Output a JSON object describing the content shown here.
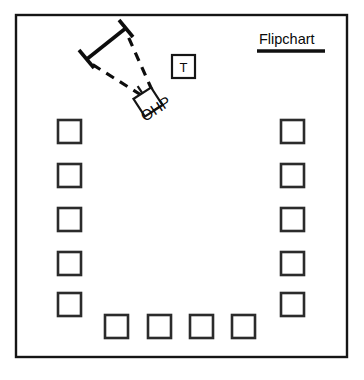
{
  "diagram": {
    "background_color": "#ffffff",
    "line_color": "#151515",
    "room": {
      "name": "room-outline",
      "x": 16,
      "y": 15,
      "width": 331,
      "height": 342
    },
    "labels": {
      "flipchart": "Flipchart",
      "ohp": "OHP",
      "trainer": "T"
    },
    "equipment": [
      {
        "name": "flipchart",
        "label": "Flipchart",
        "type": "text-with-rule",
        "x": 259,
        "y": 44
      },
      {
        "name": "trainer-table",
        "label": "T",
        "type": "square",
        "x": 172,
        "y": 55,
        "size": 23
      },
      {
        "name": "overhead-projector",
        "label": "OHP",
        "type": "rotated-square",
        "cx": 148,
        "cy": 102,
        "size": 21,
        "rotation": -33
      },
      {
        "name": "projection-screen",
        "label": "",
        "type": "screen",
        "x1": 87,
        "y1": 59,
        "x2": 126,
        "y2": 28
      }
    ],
    "projection_beam": {
      "name": "projection-beam",
      "style": "dashed",
      "rays": [
        {
          "from_x": 141,
          "from_y": 94,
          "to_x": 90,
          "to_y": 62
        },
        {
          "from_x": 152,
          "from_y": 90,
          "to_x": 126,
          "to_y": 33
        }
      ]
    },
    "seats": {
      "count": 14,
      "size": 23,
      "left_column": [
        {
          "name": "seat-left-1",
          "x": 58,
          "y": 120
        },
        {
          "name": "seat-left-2",
          "x": 58,
          "y": 164
        },
        {
          "name": "seat-left-3",
          "x": 58,
          "y": 208
        },
        {
          "name": "seat-left-4",
          "x": 58,
          "y": 252
        },
        {
          "name": "seat-left-5",
          "x": 58,
          "y": 293
        }
      ],
      "right_column": [
        {
          "name": "seat-right-1",
          "x": 281,
          "y": 120
        },
        {
          "name": "seat-right-2",
          "x": 281,
          "y": 164
        },
        {
          "name": "seat-right-3",
          "x": 281,
          "y": 208
        },
        {
          "name": "seat-right-4",
          "x": 281,
          "y": 252
        },
        {
          "name": "seat-right-5",
          "x": 281,
          "y": 293
        }
      ],
      "bottom_row": [
        {
          "name": "seat-bottom-1",
          "x": 105,
          "y": 315
        },
        {
          "name": "seat-bottom-2",
          "x": 148,
          "y": 315
        },
        {
          "name": "seat-bottom-3",
          "x": 190,
          "y": 315
        },
        {
          "name": "seat-bottom-4",
          "x": 232,
          "y": 315
        }
      ]
    }
  }
}
